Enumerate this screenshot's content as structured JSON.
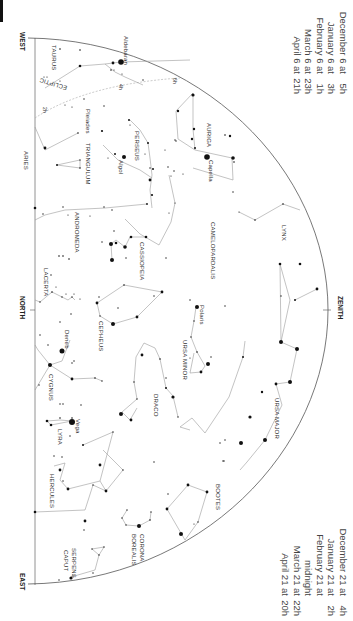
{
  "chart": {
    "orientation": "rotated 90 degrees clockwise",
    "directions": {
      "west": "WEST",
      "north": "NORTH",
      "east": "EAST",
      "zenith": "ZENITH"
    },
    "ecliptic_label": "ECLIPTIC",
    "ecliptic_marks": [
      "6h",
      "4h",
      "2h"
    ],
    "constellations": [
      "TAURUS",
      "ARIES",
      "TRIANGULUM",
      "PERSEUS",
      "AURIGA",
      "ANDROMEDA",
      "CASSIOPEIA",
      "CAMELOPARDALIS",
      "LYNX",
      "LACERTA",
      "CEPHEUS",
      "URSA MINOR",
      "URSA MAJOR",
      "CYGNUS",
      "DRACO",
      "LYRA",
      "HERCULES",
      "BOOTES",
      "CORONA BOREALIS",
      "SERPENS CAPUT"
    ],
    "stars": [
      "Aldebaran",
      "Pleiades",
      "Algol",
      "Capella",
      "Polaris",
      "Deneb",
      "Vega"
    ],
    "labels": {
      "taurus": "TAURUS",
      "aries": "ARIES",
      "triangulum": "TRIANGULUM",
      "perseus": "PERSEUS",
      "auriga": "AURIGA",
      "andromeda": "ANDROMEDA",
      "cassiopeia": "CASSIOPEIA",
      "camelopardalis": "CAMELOPARDALIS",
      "lynx": "LYNX",
      "lacerta": "LACERTA",
      "cepheus": "CEPHEUS",
      "ursa_minor": "URSA MINOR",
      "ursa_major": "URSA MAJOR",
      "cygnus": "CYGNUS",
      "draco": "DRACO",
      "lyra": "LYRA",
      "hercules": "HERCULES",
      "bootes": "BOOTES",
      "corona": "CORONA",
      "borealis": "BOREALIS",
      "serpens": "SERPENS",
      "caput": "CAPUT",
      "aldebaran": "Aldebaran",
      "pleiades": "Pleiades",
      "algol": "Algol",
      "capella": "Capella",
      "polaris": "Polaris",
      "deneb": "Deneb",
      "vega": "Vega"
    }
  },
  "times_top": [
    {
      "date": "December 6 at",
      "time": "5h"
    },
    {
      "date": "January 6 at",
      "time": "3h"
    },
    {
      "date": "February 6 at",
      "time": "1h"
    },
    {
      "date": "March 6 at",
      "time": "23h"
    },
    {
      "date": "April 6 at",
      "time": "21h"
    }
  ],
  "times_bottom": [
    {
      "date": "December 21 at",
      "time": "4h"
    },
    {
      "date": "January 21 at",
      "time": "2h"
    },
    {
      "date": "February 21 at midnight",
      "time": ""
    },
    {
      "date": "March 21 at",
      "time": "22h"
    },
    {
      "date": "April 21 at",
      "time": "20h"
    }
  ],
  "colors": {
    "line": "#9a9a9a",
    "horizon": "#555555",
    "star": "#111111",
    "text": "#333333"
  }
}
